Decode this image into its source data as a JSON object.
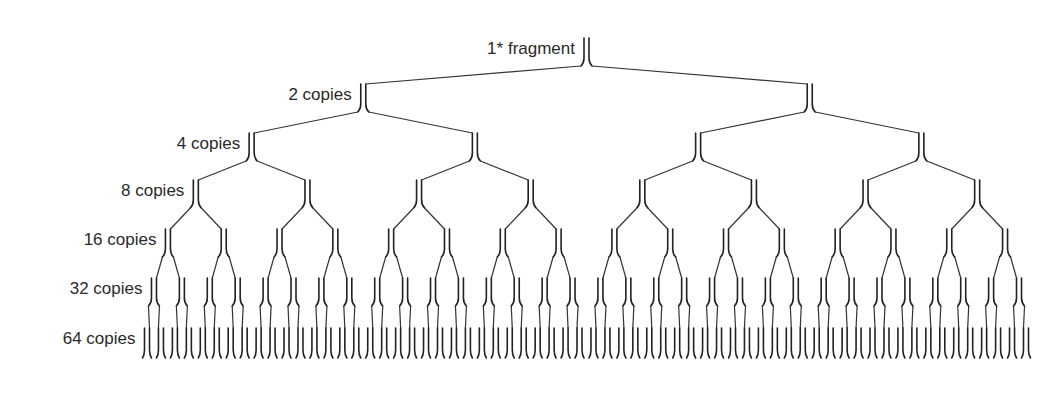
{
  "diagram": {
    "ink_color": "#222222",
    "background": "#ffffff",
    "levels": [
      {
        "label": "1* fragment",
        "count": 1,
        "y_top": 38,
        "y_bottom": 66
      },
      {
        "label": "2 copies",
        "count": 2,
        "y_top": 84,
        "y_bottom": 112
      },
      {
        "label": "4 copies",
        "count": 4,
        "y_top": 133,
        "y_bottom": 161
      },
      {
        "label": "8 copies",
        "count": 8,
        "y_top": 180,
        "y_bottom": 208
      },
      {
        "label": "16 copies",
        "count": 16,
        "y_top": 229,
        "y_bottom": 257
      },
      {
        "label": "32 copies",
        "count": 32,
        "y_top": 278,
        "y_bottom": 306
      },
      {
        "label": "64 copies",
        "count": 64,
        "y_top": 328,
        "y_bottom": 358
      }
    ],
    "leaf_x_start": 147,
    "leaf_x_end": 1026,
    "strand_gap": 5
  }
}
